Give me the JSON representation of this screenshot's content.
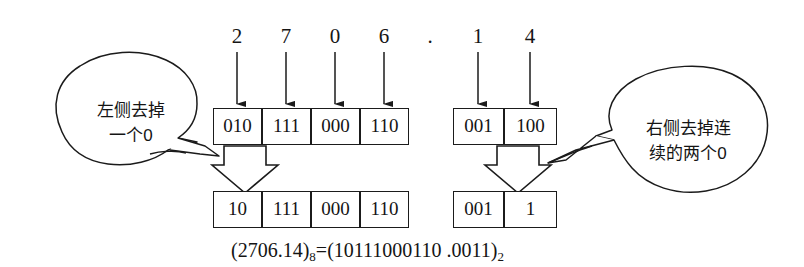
{
  "figure": {
    "type": "conversion-diagram",
    "caption": {
      "octal_open": "(",
      "octal_value": "2706.14",
      "octal_close": ")",
      "octal_base": "8",
      "equals": "=",
      "binary_open": "(",
      "binary_value": "10111000110 .0011",
      "binary_close": ")",
      "binary_base": "2"
    },
    "radix_point": "."
  },
  "octal_digits": {
    "integer_part": [
      "2",
      "7",
      "0",
      "6"
    ],
    "fraction_part": [
      "1",
      "4"
    ]
  },
  "rows": {
    "top_integer": {
      "label": "expanded-integer-groups",
      "cells": [
        "010",
        "111",
        "000",
        "110"
      ]
    },
    "top_fraction": {
      "label": "expanded-fraction-groups",
      "cells": [
        "001",
        "100"
      ]
    },
    "bottom_integer": {
      "label": "trimmed-integer-groups",
      "cells": [
        "10",
        "111",
        "000",
        "110"
      ]
    },
    "bottom_fraction": {
      "label": "trimmed-fraction-groups",
      "cells": [
        "001",
        "1"
      ]
    }
  },
  "callouts": {
    "left": {
      "text": "左侧去掉\n一个0"
    },
    "right": {
      "text": "右侧去掉连\n续的两个0"
    }
  },
  "colors": {
    "ink": "#1b1b1b",
    "paper": "#ffffff"
  }
}
